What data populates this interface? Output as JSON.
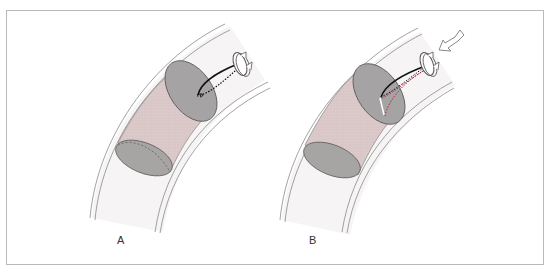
{
  "figure": {
    "panels": [
      {
        "id": "A",
        "label": "A",
        "catheter": "pre-advancement",
        "push_arrow": false
      },
      {
        "id": "B",
        "label": "B",
        "catheter": "advanced-with-rotation",
        "push_arrow": true
      }
    ],
    "colors": {
      "frame": "#b9b9b9",
      "vessel_wall": "#8a8a8a",
      "lumen": "#f4f2f2",
      "lesion_body": "#dcc9c9",
      "lesion_cap": "#a3a0a0",
      "catheter": "#111111",
      "catheter_path_red": "#b0263a"
    },
    "icons": [
      "rotation-arrow-icon",
      "push-arrow-icon"
    ]
  }
}
